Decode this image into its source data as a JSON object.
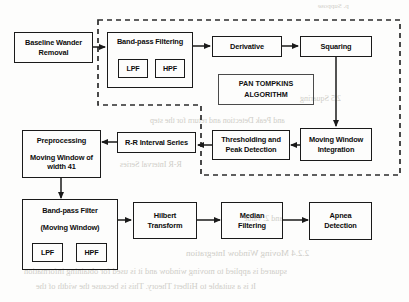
{
  "diagram": {
    "title_group": "PAN TOMPKINS ALGORITHM",
    "nodes": {
      "baseline": {
        "label": "Baseline Wander",
        "label2": "Removal"
      },
      "bandpass_top": {
        "label": "Band-pass Filtering"
      },
      "lpf_top": {
        "label": "LPF"
      },
      "hpf_top": {
        "label": "HPF"
      },
      "derivative": {
        "label": "Derivative"
      },
      "squaring": {
        "label": "Squaring"
      },
      "pan_tompkins": {
        "label": "PAN TOMPKINS",
        "label2": "ALGORITHM"
      },
      "moving_window_integration": {
        "label": "Moving Window",
        "label2": "Integration"
      },
      "thresholding": {
        "label": "Thresholding and",
        "label2": "Peak Detection"
      },
      "rr_interval": {
        "label": "R-R Interval Series"
      },
      "preprocessing": {
        "label": "Preprocessing",
        "label2": "Moving Window of",
        "label3": "width 41"
      },
      "bandpass_bottom": {
        "label": "Band-pass Filter",
        "label2": "(Moving Window)"
      },
      "lpf_bottom": {
        "label": "LPF"
      },
      "hpf_bottom": {
        "label": "HPF"
      },
      "hilbert": {
        "label": "Hilbert",
        "label2": "Transform"
      },
      "median": {
        "label": "Median",
        "label2": "Filtering"
      },
      "apnea": {
        "label": "Apnea",
        "label2": "Detection"
      }
    },
    "colors": {
      "stroke": "#1a1a1a",
      "dashed_stroke": "#2b2b2b",
      "background": "#fdfdfc",
      "watermark": "#cfcdc8"
    },
    "watermarks": [
      {
        "text": "p. Suppose",
        "x": 318,
        "y": 4
      },
      {
        "text": "2.5 Squaring",
        "x": 300,
        "y": 96
      },
      {
        "text": "2.2.4 Moving Window Integration",
        "x": 186,
        "y": 250
      },
      {
        "text": "squared is applied to moving window and it is used for obtaining information",
        "x": 28,
        "y": 268
      },
      {
        "text": "It is a suitable to Hilbert Theory. This is because the width of the",
        "x": 38,
        "y": 283
      },
      {
        "text": "R-R Interval Series",
        "x": 120,
        "y": 162
      },
      {
        "text": "and Peak Detection and return for the step",
        "x": 150,
        "y": 118
      },
      {
        "text": "and 2. value",
        "x": 244,
        "y": 216
      }
    ]
  }
}
